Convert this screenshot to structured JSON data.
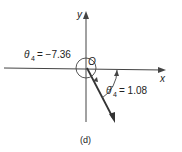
{
  "diagram": {
    "axes": {
      "x_label": "x",
      "y_label": "y",
      "origin_label": "O"
    },
    "angle_negative": {
      "symbol": "θ",
      "subscript": "4",
      "eq": "= −7.36"
    },
    "angle_positive": {
      "symbol": "θ̄",
      "subscript": "4",
      "eq": "= 1.08"
    },
    "caption": "(d)",
    "colors": {
      "line": "#333333",
      "text": "#222222"
    }
  }
}
